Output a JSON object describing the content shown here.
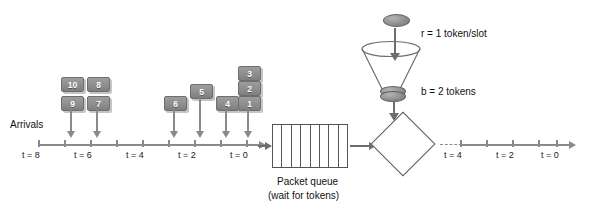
{
  "diagram": {
    "arrivals_label": "Arrivals",
    "queue_caption_line1": "Packet queue",
    "queue_caption_line2": "(wait for tokens)",
    "rate_label": "r = 1 token/slot",
    "bucket_label": "b = 2 tokens",
    "colors": {
      "packet_fill": "#8e8e8e",
      "packet_border": "#6e6e6e",
      "packet_text": "#ffffff",
      "axis": "#8a8a8a",
      "outline": "#555555",
      "token_fill": "#8c8c8c",
      "background": "#ffffff"
    }
  },
  "arrivals_timeline": {
    "tick_labels": [
      "t = 8",
      "t = 6",
      "t = 4",
      "t = 2",
      "t = 0"
    ],
    "tick_count": 9,
    "packets_by_slot": [
      {
        "slot": "t = 8",
        "packets": [
          "9",
          "10"
        ]
      },
      {
        "slot": "t = 6",
        "packets": [
          "7",
          "8"
        ]
      },
      {
        "slot": "t = 4",
        "packets": []
      },
      {
        "slot": "t = 3",
        "packets": [
          "6"
        ]
      },
      {
        "slot": "t = 2",
        "packets": [
          "5"
        ]
      },
      {
        "slot": "t = 1",
        "packets": [
          "4"
        ]
      },
      {
        "slot": "t = 0",
        "packets": [
          "1",
          "2",
          "3"
        ]
      }
    ],
    "packet_labels": [
      "10",
      "8",
      "9",
      "7",
      "5",
      "6",
      "3",
      "2",
      "4",
      "1"
    ]
  },
  "departures_timeline": {
    "tick_labels": [
      "t = 4",
      "t = 2",
      "t = 0"
    ],
    "tick_count": 5
  },
  "queue": {
    "cell_count": 8
  },
  "token_bucket": {
    "incoming_tokens": 1,
    "stored_tokens": 2
  }
}
